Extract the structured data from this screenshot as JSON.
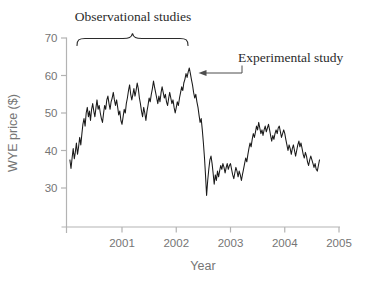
{
  "figure": {
    "annotations": {
      "observational": {
        "text": "Observational studies",
        "span_years": [
          2000.17,
          2002.22
        ]
      },
      "experimental": {
        "text": "Experimental study",
        "points_to_year": 2002.24,
        "points_to_price": 62
      }
    },
    "colors": {
      "line": "#1a1a1a",
      "axis": "#b3b3b3",
      "tick_label": "#757575",
      "annotation_text": "#2b2b2b",
      "arrow": "#4d4d4d",
      "background": "#ffffff"
    }
  },
  "chart_data": {
    "type": "line",
    "title": "",
    "xlabel": "Year",
    "ylabel": "WYE price ($)",
    "x_ticks": [
      2001,
      2002,
      2003,
      2004,
      2005
    ],
    "y_ticks": [
      30,
      40,
      50,
      60,
      70
    ],
    "xlim": [
      2000,
      2005
    ],
    "ylim": [
      30,
      70
    ],
    "grid": false,
    "legend": "none",
    "series_name": "WYE price",
    "points": [
      [
        2000.04,
        37.5
      ],
      [
        2000.06,
        35.2
      ],
      [
        2000.08,
        38.0
      ],
      [
        2000.1,
        40.5
      ],
      [
        2000.12,
        37.8
      ],
      [
        2000.14,
        39.5
      ],
      [
        2000.16,
        42.0
      ],
      [
        2000.18,
        39.0
      ],
      [
        2000.2,
        41.0
      ],
      [
        2000.22,
        43.5
      ],
      [
        2000.24,
        41.5
      ],
      [
        2000.26,
        44.5
      ],
      [
        2000.28,
        47.0
      ],
      [
        2000.3,
        48.5
      ],
      [
        2000.32,
        46.5
      ],
      [
        2000.34,
        50.0
      ],
      [
        2000.36,
        51.5
      ],
      [
        2000.38,
        49.0
      ],
      [
        2000.4,
        50.5
      ],
      [
        2000.42,
        48.0
      ],
      [
        2000.44,
        51.0
      ],
      [
        2000.46,
        52.5
      ],
      [
        2000.48,
        50.5
      ],
      [
        2000.5,
        49.0
      ],
      [
        2000.52,
        51.5
      ],
      [
        2000.54,
        53.5
      ],
      [
        2000.56,
        51.0
      ],
      [
        2000.58,
        52.0
      ],
      [
        2000.6,
        50.0
      ],
      [
        2000.62,
        48.5
      ],
      [
        2000.64,
        47.5
      ],
      [
        2000.66,
        50.0
      ],
      [
        2000.68,
        52.0
      ],
      [
        2000.7,
        51.0
      ],
      [
        2000.72,
        53.5
      ],
      [
        2000.74,
        54.5
      ],
      [
        2000.76,
        52.5
      ],
      [
        2000.78,
        51.0
      ],
      [
        2000.8,
        53.0
      ],
      [
        2000.82,
        54.0
      ],
      [
        2000.84,
        55.5
      ],
      [
        2000.86,
        53.5
      ],
      [
        2000.88,
        52.0
      ],
      [
        2000.9,
        53.5
      ],
      [
        2000.92,
        51.5
      ],
      [
        2000.94,
        49.5
      ],
      [
        2000.96,
        50.5
      ],
      [
        2000.98,
        48.0
      ],
      [
        2001.0,
        47.0
      ],
      [
        2001.02,
        49.0
      ],
      [
        2001.04,
        51.0
      ],
      [
        2001.06,
        50.0
      ],
      [
        2001.08,
        52.5
      ],
      [
        2001.1,
        54.0
      ],
      [
        2001.12,
        56.0
      ],
      [
        2001.14,
        57.5
      ],
      [
        2001.16,
        55.0
      ],
      [
        2001.18,
        53.5
      ],
      [
        2001.2,
        55.0
      ],
      [
        2001.22,
        56.5
      ],
      [
        2001.24,
        54.5
      ],
      [
        2001.26,
        56.0
      ],
      [
        2001.28,
        58.0
      ],
      [
        2001.3,
        56.5
      ],
      [
        2001.32,
        54.0
      ],
      [
        2001.34,
        52.5
      ],
      [
        2001.36,
        50.5
      ],
      [
        2001.38,
        49.0
      ],
      [
        2001.4,
        51.5
      ],
      [
        2001.42,
        50.0
      ],
      [
        2001.44,
        48.0
      ],
      [
        2001.46,
        50.5
      ],
      [
        2001.48,
        52.0
      ],
      [
        2001.5,
        54.0
      ],
      [
        2001.52,
        53.0
      ],
      [
        2001.54,
        55.0
      ],
      [
        2001.56,
        56.5
      ],
      [
        2001.58,
        58.5
      ],
      [
        2001.6,
        57.0
      ],
      [
        2001.62,
        55.5
      ],
      [
        2001.64,
        54.0
      ],
      [
        2001.66,
        52.5
      ],
      [
        2001.68,
        54.5
      ],
      [
        2001.7,
        53.0
      ],
      [
        2001.72,
        55.5
      ],
      [
        2001.74,
        57.0
      ],
      [
        2001.76,
        55.5
      ],
      [
        2001.78,
        54.0
      ],
      [
        2001.8,
        55.0
      ],
      [
        2001.82,
        53.0
      ],
      [
        2001.84,
        52.0
      ],
      [
        2001.86,
        54.0
      ],
      [
        2001.88,
        55.5
      ],
      [
        2001.9,
        54.0
      ],
      [
        2001.92,
        52.5
      ],
      [
        2001.94,
        53.5
      ],
      [
        2001.96,
        51.5
      ],
      [
        2001.98,
        50.0
      ],
      [
        2002.0,
        51.5
      ],
      [
        2002.02,
        53.0
      ],
      [
        2002.04,
        52.0
      ],
      [
        2002.06,
        54.0
      ],
      [
        2002.08,
        55.5
      ],
      [
        2002.1,
        57.0
      ],
      [
        2002.12,
        56.0
      ],
      [
        2002.14,
        58.0
      ],
      [
        2002.16,
        59.0
      ],
      [
        2002.18,
        60.5
      ],
      [
        2002.2,
        59.5
      ],
      [
        2002.22,
        61.0
      ],
      [
        2002.24,
        62.0
      ],
      [
        2002.26,
        60.5
      ],
      [
        2002.28,
        59.0
      ],
      [
        2002.3,
        57.5
      ],
      [
        2002.32,
        55.5
      ],
      [
        2002.34,
        54.0
      ],
      [
        2002.36,
        55.0
      ],
      [
        2002.38,
        53.0
      ],
      [
        2002.4,
        51.5
      ],
      [
        2002.42,
        49.5
      ],
      [
        2002.44,
        47.5
      ],
      [
        2002.46,
        48.5
      ],
      [
        2002.48,
        45.5
      ],
      [
        2002.5,
        42.0
      ],
      [
        2002.52,
        38.0
      ],
      [
        2002.54,
        33.5
      ],
      [
        2002.56,
        28.0
      ],
      [
        2002.58,
        32.0
      ],
      [
        2002.6,
        35.0
      ],
      [
        2002.62,
        37.5
      ],
      [
        2002.64,
        38.5
      ],
      [
        2002.66,
        36.5
      ],
      [
        2002.68,
        34.0
      ],
      [
        2002.7,
        31.0
      ],
      [
        2002.72,
        33.5
      ],
      [
        2002.74,
        32.0
      ],
      [
        2002.76,
        34.5
      ],
      [
        2002.78,
        33.0
      ],
      [
        2002.8,
        34.5
      ],
      [
        2002.82,
        36.0
      ],
      [
        2002.84,
        35.0
      ],
      [
        2002.86,
        36.5
      ],
      [
        2002.88,
        35.5
      ],
      [
        2002.9,
        34.0
      ],
      [
        2002.92,
        35.5
      ],
      [
        2002.94,
        36.5
      ],
      [
        2002.96,
        35.0
      ],
      [
        2002.98,
        36.0
      ],
      [
        2003.0,
        36.5
      ],
      [
        2003.02,
        35.0
      ],
      [
        2003.04,
        33.5
      ],
      [
        2003.06,
        32.5
      ],
      [
        2003.08,
        34.0
      ],
      [
        2003.1,
        35.5
      ],
      [
        2003.12,
        34.5
      ],
      [
        2003.14,
        33.0
      ],
      [
        2003.16,
        34.5
      ],
      [
        2003.18,
        33.5
      ],
      [
        2003.2,
        32.0
      ],
      [
        2003.22,
        33.5
      ],
      [
        2003.24,
        35.0
      ],
      [
        2003.26,
        36.5
      ],
      [
        2003.28,
        38.0
      ],
      [
        2003.3,
        37.0
      ],
      [
        2003.32,
        39.0
      ],
      [
        2003.34,
        40.5
      ],
      [
        2003.36,
        42.0
      ],
      [
        2003.38,
        41.0
      ],
      [
        2003.4,
        43.0
      ],
      [
        2003.42,
        44.5
      ],
      [
        2003.44,
        43.5
      ],
      [
        2003.46,
        45.0
      ],
      [
        2003.48,
        46.5
      ],
      [
        2003.5,
        45.5
      ],
      [
        2003.52,
        47.5
      ],
      [
        2003.54,
        46.0
      ],
      [
        2003.56,
        44.5
      ],
      [
        2003.58,
        45.5
      ],
      [
        2003.6,
        44.0
      ],
      [
        2003.62,
        45.5
      ],
      [
        2003.64,
        46.5
      ],
      [
        2003.66,
        45.0
      ],
      [
        2003.68,
        46.0
      ],
      [
        2003.7,
        47.0
      ],
      [
        2003.72,
        45.5
      ],
      [
        2003.74,
        44.0
      ],
      [
        2003.76,
        42.5
      ],
      [
        2003.78,
        44.0
      ],
      [
        2003.8,
        43.0
      ],
      [
        2003.82,
        44.5
      ],
      [
        2003.84,
        45.5
      ],
      [
        2003.86,
        44.5
      ],
      [
        2003.88,
        46.0
      ],
      [
        2003.9,
        46.5
      ],
      [
        2003.92,
        45.0
      ],
      [
        2003.94,
        43.5
      ],
      [
        2003.96,
        44.5
      ],
      [
        2003.98,
        45.5
      ],
      [
        2004.0,
        44.5
      ],
      [
        2004.02,
        43.0
      ],
      [
        2004.04,
        41.5
      ],
      [
        2004.06,
        40.0
      ],
      [
        2004.08,
        41.5
      ],
      [
        2004.1,
        40.5
      ],
      [
        2004.12,
        39.0
      ],
      [
        2004.14,
        40.5
      ],
      [
        2004.16,
        41.5
      ],
      [
        2004.18,
        40.0
      ],
      [
        2004.2,
        38.5
      ],
      [
        2004.22,
        40.0
      ],
      [
        2004.24,
        41.5
      ],
      [
        2004.26,
        42.5
      ],
      [
        2004.28,
        41.0
      ],
      [
        2004.3,
        42.0
      ],
      [
        2004.32,
        40.5
      ],
      [
        2004.34,
        39.0
      ],
      [
        2004.36,
        38.0
      ],
      [
        2004.38,
        39.5
      ],
      [
        2004.4,
        38.5
      ],
      [
        2004.42,
        37.0
      ],
      [
        2004.44,
        36.0
      ],
      [
        2004.46,
        37.5
      ],
      [
        2004.48,
        38.5
      ],
      [
        2004.5,
        37.5
      ],
      [
        2004.52,
        36.5
      ],
      [
        2004.54,
        35.5
      ],
      [
        2004.56,
        36.5
      ],
      [
        2004.58,
        35.0
      ],
      [
        2004.6,
        34.5
      ],
      [
        2004.62,
        36.0
      ],
      [
        2004.64,
        37.5
      ]
    ]
  }
}
